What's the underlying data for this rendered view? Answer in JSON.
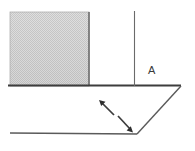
{
  "figure": {
    "type": "engineering-line-drawing",
    "canvas": {
      "width": 195,
      "height": 151,
      "background": "#ffffff"
    },
    "labels": [
      {
        "id": "A",
        "text": "A",
        "x": 148,
        "y": 74
      }
    ],
    "colors": {
      "line": "#4a4a4a",
      "thick_line": "#3d3d3d",
      "hatch_fill": "#cfcfcf",
      "hatch_stroke": "#b4b4b4",
      "label": "#3a3a3a",
      "background": "#ffffff"
    },
    "shapes": {
      "hatched_block": {
        "name": "hatched-block",
        "x": 10,
        "y": 12,
        "width": 79,
        "height": 74,
        "fill": "#cfcfcf",
        "pattern": "checker-dither"
      },
      "top_surface_line": {
        "name": "top-surface-line",
        "x1": 8,
        "y1": 86,
        "x2": 181,
        "y2": 86,
        "width": 2
      },
      "vertical_reference_line": {
        "name": "vertical-reference-line",
        "x1": 134,
        "y1": 11,
        "x2": 134,
        "y2": 86,
        "width": 1
      },
      "chamfer_right_edge": {
        "name": "chamfer-right-edge",
        "x1": 181,
        "y1": 86,
        "x2": 137,
        "y2": 134,
        "width": 1.4
      },
      "bottom_surface_line": {
        "name": "bottom-surface-line",
        "x1": 10,
        "y1": 133,
        "x2": 137,
        "y2": 134,
        "width": 1.4
      },
      "dimension_arrow": {
        "name": "dimension-arrow",
        "start_x": 100,
        "start_y": 101,
        "end_x": 131,
        "end_y": 131,
        "style": "double-headed-broken",
        "width": 1.6,
        "segments": [
          {
            "x1": 100,
            "y1": 101,
            "x2": 114,
            "y2": 114
          },
          {
            "x1": 118,
            "y1": 116,
            "x2": 131,
            "y2": 131
          }
        ]
      }
    }
  }
}
